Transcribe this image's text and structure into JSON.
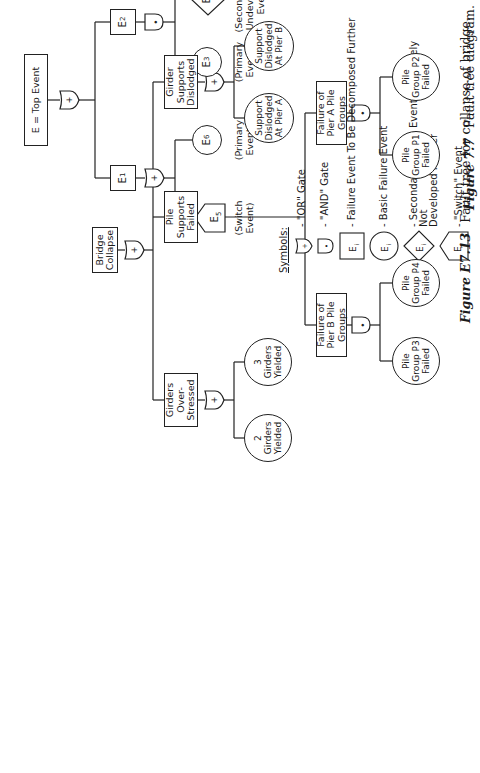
{
  "figure_7_7": {
    "top_event": "E = Top Event",
    "nodes": {
      "e1": {
        "label": "E",
        "sub": "1"
      },
      "e2": {
        "label": "E",
        "sub": "2"
      },
      "e3": {
        "label": "E",
        "sub": "3"
      },
      "e4": {
        "label": "E",
        "sub": "4"
      },
      "e5": {
        "label": "E",
        "sub": "5"
      },
      "e6": {
        "label": "E",
        "sub": "6"
      }
    },
    "annotations": {
      "e5": "(Switch\nEvent)",
      "e6": "(Primary\nEvent)",
      "e3": "(Primary\nEvent)",
      "e4": "(Secondary or\nUndeveloped\nEvent)"
    },
    "gates": {
      "top": "+",
      "e1": "+",
      "e2": "•"
    },
    "legend": {
      "title": "Symbols:",
      "items": [
        {
          "symbol": "or-gate",
          "text": "- \"OR\" Gate"
        },
        {
          "symbol": "and-gate",
          "text": "- \"AND\" Gate"
        },
        {
          "symbol": "rectangle",
          "text": "- Failure Event To Be Decomposed Further"
        },
        {
          "symbol": "circle",
          "text": "- Basic Failure Event"
        },
        {
          "symbol": "diamond",
          "text": "- Secondary Failure Event ; Purposely Not\n  Developed Further"
        },
        {
          "symbol": "house",
          "text": "- \"Switch\" Event"
        }
      ],
      "symbol_label": "E",
      "symbol_sub": "i"
    },
    "caption_num": "Figure 7.7",
    "caption_text": "Fault tree diagram."
  },
  "figure_e7_13": {
    "top": "Bridge\nCollapse",
    "level1": [
      {
        "id": "girder-supports",
        "label": "Girder\nSupports\nDislodged",
        "gate": "+"
      },
      {
        "id": "pile-supports",
        "label": "Pile\nSupports\nFailed",
        "gate": "+"
      },
      {
        "id": "girders-over",
        "label": "Girders\nOver-\nStressed",
        "gate": "+"
      }
    ],
    "girder_children": [
      "Support\nDislodged\nAt Pier A",
      "Support\nDislodged\nAt Pier B"
    ],
    "pile_children": [
      {
        "label": "Failure of\nPier A Pile\nGroups",
        "gate": "•",
        "children": [
          "Pile\nGroup P1\nFailed",
          "Pile\nGroup P2\nFailed"
        ]
      },
      {
        "label": "Failure of\nPier B Pile\nGroups",
        "gate": "•",
        "children": [
          "Pile\nGroup P3\nFailed",
          "Pile\nGroup P4\nFailed"
        ]
      }
    ],
    "girders_children": [
      "2\nGirders\nYielded",
      "3\nGirders\nYielded"
    ],
    "top_gate": "+",
    "caption_num": "Figure E7.13",
    "caption_text": "Fault tree for collapse of bridge."
  }
}
